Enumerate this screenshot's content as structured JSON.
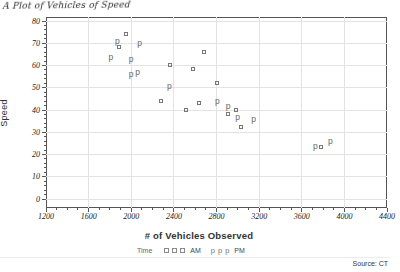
{
  "annotation": {
    "handwritten_title": "A Plot of Vehicles of Speed"
  },
  "source_note": "Source: CT",
  "chart_data": {
    "type": "scatter",
    "xlabel": "# of Vehicles Observed",
    "ylabel": "Speed",
    "xlim": [
      1200,
      4400
    ],
    "ylim": [
      0,
      80
    ],
    "x_ticks": [
      1200,
      1600,
      2000,
      2400,
      2800,
      3200,
      3600,
      4000,
      4400
    ],
    "y_ticks": [
      0,
      10,
      20,
      30,
      40,
      50,
      60,
      70,
      80
    ],
    "x_minor_step": 100,
    "y_minor_step": 2,
    "grid": true,
    "legend": {
      "title": "Time",
      "position": "bottom",
      "p_glyph": "p",
      "entries": [
        {
          "label": "AM",
          "marker": "square"
        },
        {
          "label": "PM",
          "marker": "p"
        }
      ]
    },
    "colors": {
      "marker_square": "#777777",
      "marker_p": "#666666",
      "grid": "#e3e3e3",
      "frame": "#555555",
      "tick_label": "#222222"
    },
    "series": [
      {
        "name": "AM",
        "marker": "square",
        "points": [
          [
            1960,
            74
          ],
          [
            1890,
            68
          ],
          [
            2370,
            60
          ],
          [
            2690,
            66
          ],
          [
            2580,
            58
          ],
          [
            2280,
            44
          ],
          [
            2645,
            43
          ],
          [
            2520,
            40
          ],
          [
            2810,
            52
          ],
          [
            2910,
            38
          ],
          [
            2990,
            40
          ],
          [
            3030,
            32
          ],
          [
            3790,
            23
          ]
        ]
      },
      {
        "name": "PM",
        "marker": "p",
        "points": [
          [
            1870,
            71
          ],
          [
            2080,
            70
          ],
          [
            1810,
            64
          ],
          [
            2000,
            63
          ],
          [
            2060,
            57
          ],
          [
            2000,
            56
          ],
          [
            2360,
            51
          ],
          [
            2810,
            44
          ],
          [
            2910,
            42
          ],
          [
            3000,
            37
          ],
          [
            3150,
            36
          ],
          [
            3730,
            24
          ],
          [
            3870,
            26
          ]
        ]
      }
    ]
  }
}
